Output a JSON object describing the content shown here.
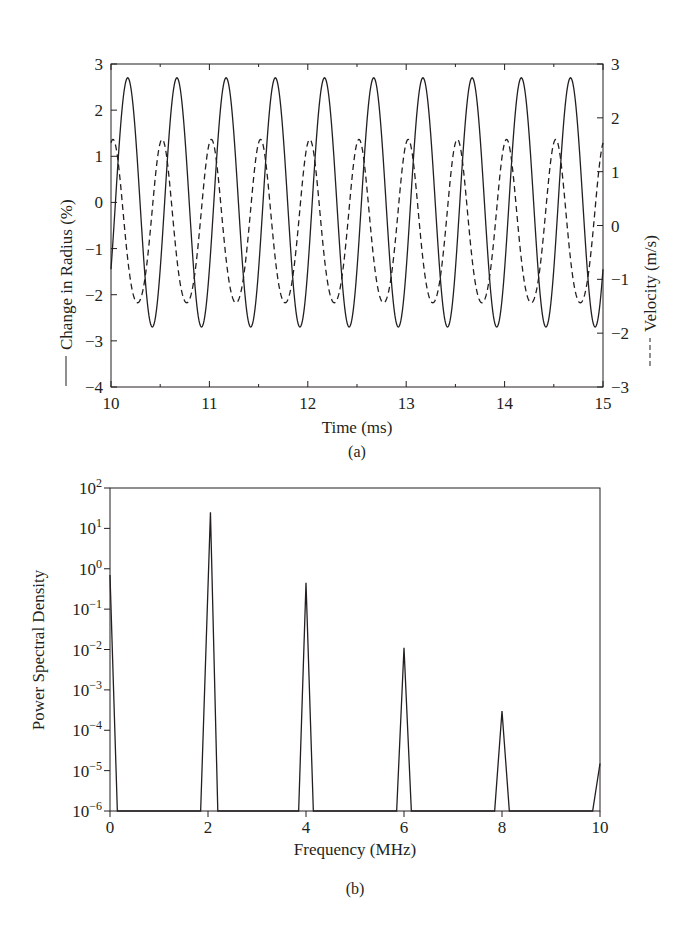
{
  "chart_data": [
    {
      "panel": "(a)",
      "type": "line",
      "title": "",
      "xlabel": "Time (ms)",
      "ylabel": "Change in Radius (%)",
      "y2label": "Velocity (m/s)",
      "xlim": [
        10,
        15
      ],
      "ylim": [
        -4,
        3
      ],
      "y2lim": [
        -3,
        3
      ],
      "xticks": [
        "10",
        "11",
        "12",
        "13",
        "14",
        "15"
      ],
      "yticks": [
        "3",
        "2",
        "1",
        "0",
        "−1",
        "−2",
        "−3",
        "−4"
      ],
      "y2ticks": [
        "3",
        "2",
        "1",
        "0",
        "−1",
        "−2",
        "−3"
      ],
      "grid": false,
      "series": [
        {
          "name": "Change in Radius (%)",
          "style": "solid",
          "axis": "left",
          "frequency_khz": 2.0,
          "amplitude": 2.7,
          "max": 2.7,
          "min": -2.7,
          "peak_times_ms": [
            10.17,
            10.67,
            11.17,
            11.67,
            12.17,
            12.67,
            13.17,
            13.67,
            14.17,
            14.67
          ],
          "trough_times_ms": [
            10.42,
            10.92,
            11.42,
            11.92,
            12.42,
            12.92,
            13.42,
            13.92,
            14.42,
            14.92
          ]
        },
        {
          "name": "Velocity (m/s)",
          "style": "dashed",
          "axis": "right",
          "frequency_khz": 2.0,
          "max": 1.6,
          "min": -1.7,
          "peak_times_ms": [
            10.02,
            10.52,
            11.02,
            11.52,
            12.02,
            12.52,
            13.02,
            13.52,
            14.02,
            14.52,
            15.0
          ],
          "trough_times_ms": [
            10.27,
            10.77,
            11.27,
            11.77,
            12.27,
            12.77,
            13.27,
            13.77,
            14.27,
            14.77
          ]
        }
      ]
    },
    {
      "panel": "(b)",
      "type": "line",
      "title": "",
      "xlabel": "Frequency (MHz)",
      "ylabel": "Power Spectral Density",
      "yscale": "log",
      "xlim": [
        0,
        10
      ],
      "ylim": [
        1e-06,
        100
      ],
      "xticks": [
        "0",
        "2",
        "4",
        "6",
        "8",
        "10"
      ],
      "yticks": [
        {
          "base": "10",
          "exp": "2"
        },
        {
          "base": "10",
          "exp": "1"
        },
        {
          "base": "10",
          "exp": "0"
        },
        {
          "base": "10",
          "exp": "−1"
        },
        {
          "base": "10",
          "exp": "−2"
        },
        {
          "base": "10",
          "exp": "−3"
        },
        {
          "base": "10",
          "exp": "−4"
        },
        {
          "base": "10",
          "exp": "−5"
        },
        {
          "base": "10",
          "exp": "−6"
        }
      ],
      "grid": false,
      "series": [
        {
          "name": "PSD",
          "x": [
            0,
            0.15,
            1.85,
            2.05,
            2.2,
            3.85,
            4.0,
            4.15,
            5.85,
            6.0,
            6.15,
            7.85,
            8.0,
            8.15,
            9.85,
            10.0
          ],
          "y": [
            0.7,
            1e-06,
            1e-06,
            25,
            1e-06,
            1e-06,
            0.45,
            1e-06,
            1e-06,
            0.011,
            1e-06,
            1e-06,
            0.0003,
            1e-06,
            1e-06,
            1.5e-05
          ]
        }
      ],
      "peaks": [
        {
          "f_mhz": 0,
          "psd": 0.7
        },
        {
          "f_mhz": 2,
          "psd": 25
        },
        {
          "f_mhz": 4,
          "psd": 0.45
        },
        {
          "f_mhz": 6,
          "psd": 0.011
        },
        {
          "f_mhz": 8,
          "psd": 0.0003
        },
        {
          "f_mhz": 10,
          "psd": 1.5e-05
        }
      ]
    }
  ],
  "captions": {
    "a": "(a)",
    "b": "(b)"
  },
  "labels": {
    "a_xlabel": "Time (ms)",
    "a_ylabel": "Change in Radius (%)",
    "a_y2label": "Velocity (m/s)",
    "b_xlabel": "Frequency (MHz)",
    "b_ylabel": "Power Spectral Density"
  },
  "colors": {
    "ink": "#231f20",
    "background": "#ffffff"
  }
}
